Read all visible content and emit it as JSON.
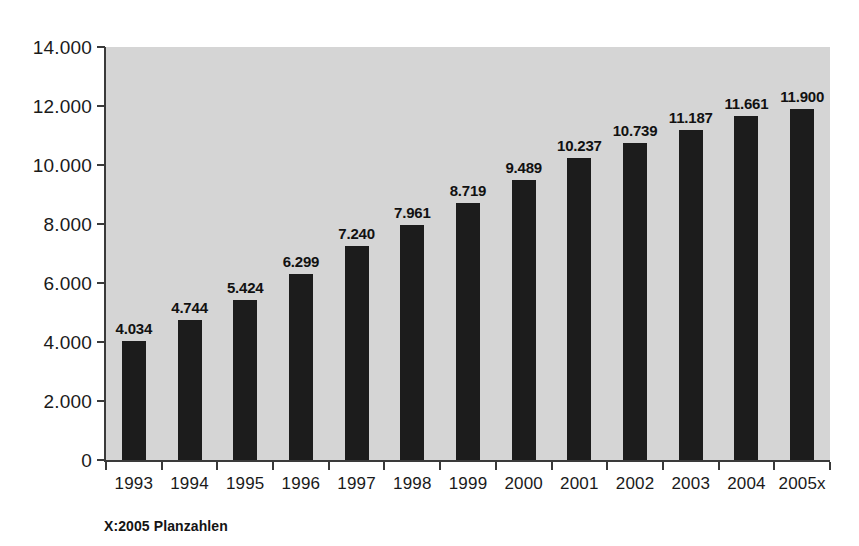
{
  "chart_data": {
    "type": "bar",
    "title": "",
    "subtitle": "",
    "xlabel": "",
    "ylabel": "",
    "categories": [
      "1993",
      "1994",
      "1995",
      "1996",
      "1997",
      "1998",
      "1999",
      "2000",
      "2001",
      "2002",
      "2003",
      "2004",
      "2005x"
    ],
    "values": [
      4034,
      4744,
      5424,
      6299,
      7240,
      7961,
      8719,
      9489,
      10237,
      10739,
      11187,
      11661,
      11900
    ],
    "value_labels": [
      "4.034",
      "4.744",
      "5.424",
      "6.299",
      "7.240",
      "7.961",
      "8.719",
      "9.489",
      "10.237",
      "10.739",
      "11.187",
      "11.661",
      "11.900"
    ],
    "ylim": [
      0,
      14000
    ],
    "ytick_values": [
      0,
      2000,
      4000,
      6000,
      8000,
      10000,
      12000,
      14000
    ],
    "ytick_labels": [
      "0",
      "2.000",
      "4.000",
      "6.000",
      "8.000",
      "10.000",
      "12.000",
      "14.000"
    ],
    "grid": false,
    "legend": null,
    "legend_position": "none",
    "annotations": [
      "X:2005 Planzahlen"
    ],
    "colors": {
      "bar": "#1c1c1c",
      "plot_background": "#d5d5d5",
      "figure_background": "#ffffff",
      "axis": "#3a3a3a",
      "text": "#1a1a1a"
    }
  },
  "footnote": {
    "text": "X:2005 Planzahlen"
  }
}
